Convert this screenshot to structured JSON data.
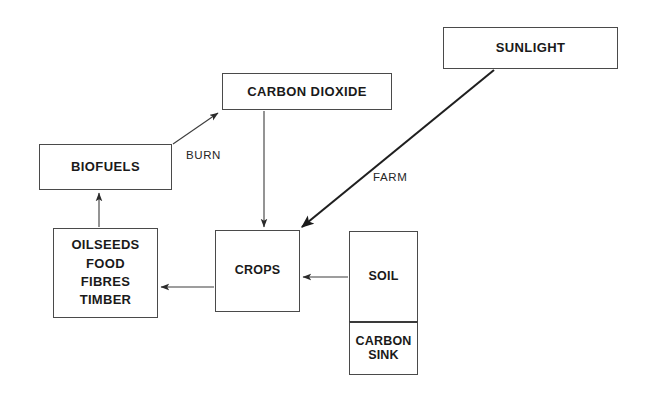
{
  "diagram": {
    "background_color": "#ffffff",
    "stroke_color": "#4a4a4a",
    "text_color": "#1a1a1a",
    "nodes": {
      "sunlight": {
        "label": "SUNLIGHT"
      },
      "carbon_dioxide": {
        "label": "CARBON DIOXIDE"
      },
      "biofuels": {
        "label": "BIOFUELS"
      },
      "products": {
        "label": "OILSEEDS\nFOOD\nFIBRES\nTIMBER"
      },
      "crops": {
        "label": "CROPS"
      },
      "soil": {
        "label": "SOIL"
      },
      "carbon_sink": {
        "label": "CARBON\nSINK"
      }
    },
    "edges": {
      "biofuels_to_carbon_dioxide": {
        "label": "BURN",
        "from": "BIOFUELS",
        "to": "CARBON DIOXIDE"
      },
      "sunlight_to_crops": {
        "label": "FARM",
        "from": "SUNLIGHT",
        "to": "CROPS"
      },
      "carbon_dioxide_to_crops": {
        "label": "",
        "from": "CARBON DIOXIDE",
        "to": "CROPS"
      },
      "crops_to_products": {
        "label": "",
        "from": "CROPS",
        "to": "OILSEEDS FOOD FIBRES TIMBER"
      },
      "products_to_biofuels": {
        "label": "",
        "from": "OILSEEDS FOOD FIBRES TIMBER",
        "to": "BIOFUELS"
      },
      "soil_to_crops": {
        "label": "",
        "from": "SOIL",
        "to": "CROPS"
      }
    }
  }
}
